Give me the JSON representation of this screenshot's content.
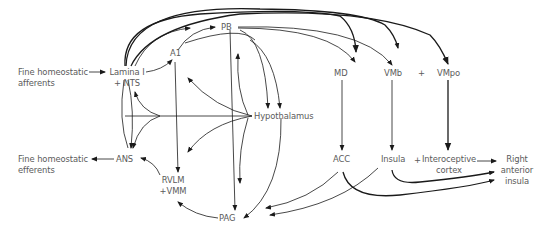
{
  "diagram": {
    "nodes": {
      "fine_afferents": "Fine homeostatic",
      "fine_afferents_2": "afferents",
      "lamina": "Lamina I",
      "lamina_2": "+ NTS",
      "a1": "A1",
      "pb": "PB",
      "md": "MD",
      "vmb": "VMb",
      "plus1": "+",
      "vmpo": "VMpo",
      "hypothalamus": "Hypothalamus",
      "fine_efferents": "Fine homeostatic",
      "fine_efferents_2": "efferents",
      "ans": "ANS",
      "rvlm": "RVLM",
      "rvlm_2": "+VMM",
      "pag": "PAG",
      "acc": "ACC",
      "insula": "Insula",
      "plus2": "+",
      "interoceptive": "Interoceptive",
      "interoceptive_2": "cortex",
      "right_ai": "Right",
      "right_ai_2": "anterior",
      "right_ai_3": "insula"
    },
    "edges": [
      {
        "from": "Fine homeostatic afferents",
        "to": "Lamina I + NTS"
      },
      {
        "from": "Lamina I + NTS",
        "to": "A1"
      },
      {
        "from": "Lamina I + NTS",
        "to": "PB"
      },
      {
        "from": "Lamina I + NTS",
        "to": "MD"
      },
      {
        "from": "Lamina I + NTS",
        "to": "VMpo"
      },
      {
        "from": "Lamina I + NTS",
        "to": "ANS"
      },
      {
        "from": "A1",
        "to": "PB"
      },
      {
        "from": "A1",
        "to": "Hypothalamus"
      },
      {
        "from": "A1",
        "to": "RVLM +VMM"
      },
      {
        "from": "PB",
        "to": "MD"
      },
      {
        "from": "PB",
        "to": "VMb"
      },
      {
        "from": "PB",
        "to": "Hypothalamus"
      },
      {
        "from": "PB",
        "to": "PAG"
      },
      {
        "from": "Hypothalamus",
        "to": "Lamina I + NTS"
      },
      {
        "from": "Hypothalamus",
        "to": "ANS"
      },
      {
        "from": "Hypothalamus",
        "to": "A1"
      },
      {
        "from": "Hypothalamus",
        "to": "RVLM +VMM"
      },
      {
        "from": "Hypothalamus",
        "to": "PB"
      },
      {
        "from": "Hypothalamus",
        "to": "PAG"
      },
      {
        "from": "ANS",
        "to": "Fine homeostatic efferents"
      },
      {
        "from": "RVLM +VMM",
        "to": "ANS"
      },
      {
        "from": "PAG",
        "to": "RVLM +VMM"
      },
      {
        "from": "MD",
        "to": "ACC"
      },
      {
        "from": "VMb",
        "to": "Insula"
      },
      {
        "from": "VMpo",
        "to": "Interoceptive cortex"
      },
      {
        "from": "ACC",
        "to": "PAG"
      },
      {
        "from": "ACC",
        "to": "Right anterior insula"
      },
      {
        "from": "Insula",
        "to": "PAG"
      },
      {
        "from": "Insula",
        "to": "Right anterior insula"
      },
      {
        "from": "Interoceptive cortex",
        "to": "Right anterior insula"
      }
    ]
  }
}
